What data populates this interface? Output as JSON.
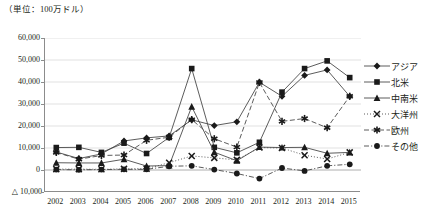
{
  "unit_note": "（単位：100万ドル）",
  "axis": {
    "y_ticks": [
      "60,000",
      "50,000",
      "40,000",
      "30,000",
      "20,000",
      "10,000",
      "0",
      "△ 10,000"
    ],
    "y_values": [
      60000,
      50000,
      40000,
      30000,
      20000,
      10000,
      0,
      -10000
    ],
    "y_min": -10000,
    "y_max": 60000,
    "x_ticks": [
      "2002",
      "2003",
      "2004",
      "2005",
      "2006",
      "2007",
      "2008",
      "2009",
      "2010",
      "2011",
      "2012",
      "2013",
      "2014",
      "2015"
    ]
  },
  "legend": {
    "position": "right",
    "items": [
      {
        "label": "アジア",
        "marker": "diamond",
        "dash": "solid",
        "color": "#1a1a1a"
      },
      {
        "label": "北米",
        "marker": "square",
        "dash": "solid",
        "color": "#1a1a1a"
      },
      {
        "label": "中南米",
        "marker": "triangle",
        "dash": "solid",
        "color": "#1a1a1a"
      },
      {
        "label": "大洋州",
        "marker": "x",
        "dash": "dotted",
        "color": "#1a1a1a"
      },
      {
        "label": "欧州",
        "marker": "asterisk",
        "dash": "dashed",
        "color": "#1a1a1a"
      },
      {
        "label": "その他",
        "marker": "circle",
        "dash": "dashdot",
        "color": "#1a1a1a"
      }
    ]
  },
  "chart_data": {
    "type": "line",
    "title": "",
    "subtitle": "",
    "xlabel": "",
    "ylabel": "（単位：100万ドル）",
    "ylim": [
      -10000,
      60000
    ],
    "grid": true,
    "legend_position": "right",
    "categories": [
      "2002",
      "2003",
      "2004",
      "2005",
      "2006",
      "2007",
      "2008",
      "2009",
      "2010",
      "2011",
      "2012",
      "2013",
      "2014",
      "2015"
    ],
    "series": [
      {
        "name": "アジア",
        "marker": "diamond",
        "dash": "solid",
        "values": [
          8200,
          5200,
          7300,
          13200,
          14600,
          15500,
          22800,
          20200,
          21900,
          39900,
          33500,
          43000,
          45500,
          33500
        ]
      },
      {
        "name": "北米",
        "marker": "square",
        "dash": "solid",
        "values": [
          10200,
          10300,
          8000,
          12200,
          7500,
          14800,
          46100,
          10300,
          7800,
          12600,
          35400,
          46100,
          49600,
          42000
        ]
      },
      {
        "name": "中南米",
        "marker": "triangle",
        "dash": "solid",
        "values": [
          3300,
          3200,
          3200,
          4900,
          1800,
          2000,
          28800,
          8100,
          4200,
          10400,
          10200,
          10300,
          7600,
          8000
        ]
      },
      {
        "name": "大洋州",
        "marker": "x",
        "dash": "dotted",
        "values": [
          400,
          400,
          300,
          500,
          600,
          3300,
          6400,
          5500,
          4600,
          10200,
          10000,
          6700,
          5000,
          8000
        ]
      },
      {
        "name": "欧州",
        "marker": "asterisk",
        "dash": "dashed",
        "values": [
          8000,
          4900,
          6600,
          6800,
          13500,
          14900,
          22900,
          14200,
          10400,
          39800,
          22100,
          23400,
          19200,
          33500
        ]
      },
      {
        "name": "その他",
        "marker": "circle",
        "dash": "dashdot",
        "values": [
          200,
          100,
          200,
          300,
          300,
          1700,
          1900,
          200,
          -1600,
          -3900,
          900,
          -400,
          1900,
          2600
        ]
      }
    ]
  }
}
